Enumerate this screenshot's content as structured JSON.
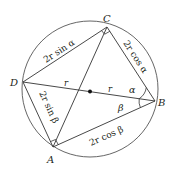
{
  "diagram": {
    "type": "cyclic-quadrilateral",
    "circle": {
      "cx": 90,
      "cy": 89,
      "r": 68
    },
    "center_marker": {
      "x": 90,
      "y": 91
    },
    "vertices": {
      "A": {
        "label": "A",
        "x": 53,
        "y": 147
      },
      "B": {
        "label": "B",
        "x": 155,
        "y": 101
      },
      "C": {
        "label": "C",
        "x": 107,
        "y": 27
      },
      "D": {
        "label": "D",
        "x": 23,
        "y": 82
      }
    },
    "side_labels": {
      "DC": "2r sin α",
      "CB": "2r cos α",
      "DA": "2r sin β",
      "AB": "2r cos β"
    },
    "radius_labels": [
      "r",
      "r"
    ],
    "angle_labels": {
      "alpha": "α",
      "beta": "β"
    },
    "right_angles_at": [
      "C",
      "A"
    ],
    "line_color": "#3a3a3a"
  }
}
